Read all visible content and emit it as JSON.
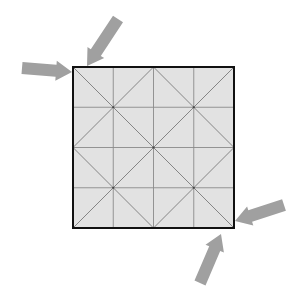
{
  "diagram": {
    "type": "origami crease pattern",
    "square": {
      "x": 73,
      "y": 67,
      "size": 161,
      "fill": "#e2e2e2",
      "border": "#111111",
      "border_width": 2
    },
    "grid": {
      "divisions": 4,
      "line_color": "#8a8a8a"
    },
    "diagonal_color": "#7a7a7a",
    "arrows": [
      {
        "name": "arrow-left-top",
        "from": [
          22,
          68
        ],
        "to": [
          72,
          72
        ],
        "color": "#a0a0a0"
      },
      {
        "name": "arrow-top-left",
        "from": [
          118,
          19
        ],
        "to": [
          87,
          66
        ],
        "color": "#a0a0a0"
      },
      {
        "name": "arrow-right-bottom",
        "from": [
          284,
          205
        ],
        "to": [
          235,
          221
        ],
        "color": "#a0a0a0"
      },
      {
        "name": "arrow-bottom-right",
        "from": [
          200,
          283
        ],
        "to": [
          221,
          234
        ],
        "color": "#a0a0a0"
      }
    ]
  }
}
